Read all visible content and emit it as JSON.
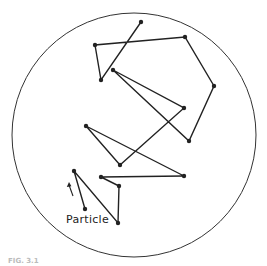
{
  "diagram": {
    "particle_label": "Particle",
    "caption": "FIG. 3.1",
    "boundary": {
      "shape": "circle",
      "cx": 134,
      "cy": 135,
      "r": 122,
      "stroke": "#333333"
    },
    "path_color": "#222222",
    "path_points": [
      [
        141,
        22
      ],
      [
        101,
        80
      ],
      [
        95,
        45
      ],
      [
        185,
        37
      ],
      [
        214,
        86
      ],
      [
        189,
        141
      ],
      [
        113,
        70
      ],
      [
        184,
        108
      ],
      [
        120,
        165
      ],
      [
        86,
        126
      ],
      [
        184,
        176
      ],
      [
        101,
        177
      ],
      [
        119,
        186
      ],
      [
        118,
        223
      ],
      [
        74,
        171
      ],
      [
        85,
        209
      ]
    ],
    "arrow": {
      "x1": 73,
      "y1": 196,
      "x2": 69,
      "y2": 182,
      "direction": "up"
    }
  }
}
